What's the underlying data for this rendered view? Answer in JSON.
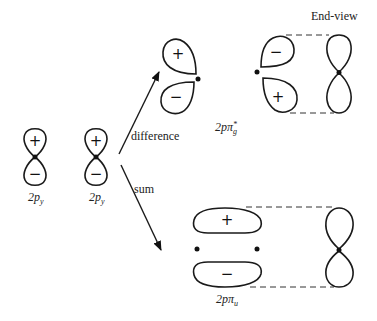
{
  "diagram": {
    "header": {
      "end_view": "End-view"
    },
    "atomic_orbitals": [
      {
        "label": "2p",
        "subscript": "y",
        "top_sign": "+",
        "bottom_sign": "−"
      },
      {
        "label": "2p",
        "subscript": "y",
        "top_sign": "+",
        "bottom_sign": "−"
      }
    ],
    "arrows": {
      "difference": "difference",
      "sum": "sum"
    },
    "antibonding": {
      "label": "2pπ",
      "subscript": "g",
      "superscript": "*",
      "left_lobe_top_sign": "+",
      "left_lobe_bottom_sign": "−",
      "right_lobe_top_sign": "−",
      "right_lobe_bottom_sign": "+"
    },
    "bonding": {
      "label": "2pπ",
      "subscript": "u",
      "top_sign": "+",
      "bottom_sign": "−"
    },
    "colors": {
      "stroke": "#1a1a1a",
      "background": "#ffffff"
    }
  }
}
